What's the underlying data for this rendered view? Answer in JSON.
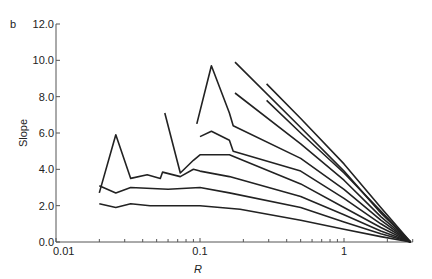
{
  "panel_label": "b",
  "chart_data": {
    "type": "line",
    "title": "",
    "panel": "b",
    "xlabel": "R",
    "ylabel": "Slope",
    "xscale": "log",
    "xlim": [
      0.01,
      3.0
    ],
    "ylim": [
      0.0,
      12.0
    ],
    "x_ticks": [
      {
        "value": 0.01,
        "label": "0.01"
      },
      {
        "value": 0.1,
        "label": "0.1"
      },
      {
        "value": 1,
        "label": "1"
      }
    ],
    "y_ticks": [
      {
        "value": 0,
        "label": "0.0"
      },
      {
        "value": 2,
        "label": "2.0"
      },
      {
        "value": 4,
        "label": "4.0"
      },
      {
        "value": 6,
        "label": "6.0"
      },
      {
        "value": 8,
        "label": "8.0"
      },
      {
        "value": 10,
        "label": "10.0"
      },
      {
        "value": 12,
        "label": "12.0"
      }
    ],
    "grid": false,
    "legend": null,
    "series": [
      {
        "name": "curve-1",
        "x": [
          0.02,
          0.026,
          0.033,
          0.045,
          0.1,
          0.19,
          0.5,
          1.0,
          1.8,
          2.9
        ],
        "y": [
          2.1,
          1.9,
          2.1,
          2.0,
          2.0,
          1.8,
          1.2,
          0.7,
          0.3,
          0.0
        ]
      },
      {
        "name": "curve-2",
        "x": [
          0.02,
          0.026,
          0.033,
          0.06,
          0.1,
          0.16,
          0.5,
          1.0,
          1.8,
          2.9
        ],
        "y": [
          3.1,
          2.7,
          3.0,
          2.9,
          3.0,
          2.7,
          1.9,
          1.1,
          0.45,
          0.0
        ]
      },
      {
        "name": "curve-3",
        "x": [
          0.02,
          0.026,
          0.033,
          0.043,
          0.053,
          0.055,
          0.073,
          0.09,
          0.1,
          0.16,
          0.5,
          1.0,
          1.8,
          2.9
        ],
        "y": [
          2.7,
          5.9,
          3.5,
          3.7,
          3.5,
          3.85,
          3.6,
          4.0,
          3.9,
          3.6,
          2.5,
          1.5,
          0.6,
          0.0
        ]
      },
      {
        "name": "curve-4",
        "x": [
          0.057,
          0.073,
          0.09,
          0.1,
          0.16,
          0.5,
          1.0,
          1.8,
          2.9
        ],
        "y": [
          7.1,
          3.8,
          4.5,
          4.8,
          4.8,
          3.2,
          1.9,
          0.8,
          0.0
        ]
      },
      {
        "name": "curve-5",
        "x": [
          0.1,
          0.12,
          0.16,
          0.17,
          0.5,
          1.0,
          1.8,
          2.9
        ],
        "y": [
          5.8,
          6.1,
          5.6,
          5.0,
          3.9,
          2.4,
          1.0,
          0.0
        ]
      },
      {
        "name": "curve-6",
        "x": [
          0.095,
          0.12,
          0.16,
          0.17,
          0.5,
          1.0,
          1.8,
          2.9
        ],
        "y": [
          6.5,
          9.7,
          7.1,
          6.4,
          4.6,
          2.9,
          1.2,
          0.0
        ]
      },
      {
        "name": "curve-7",
        "x": [
          0.175,
          0.5,
          1.0,
          1.8,
          2.9
        ],
        "y": [
          8.2,
          5.4,
          3.4,
          1.4,
          0.0
        ]
      },
      {
        "name": "curve-8",
        "x": [
          0.175,
          0.5,
          1.0,
          1.8,
          2.9
        ],
        "y": [
          9.9,
          6.3,
          3.9,
          1.6,
          0.0
        ]
      },
      {
        "name": "curve-9",
        "x": [
          0.29,
          0.5,
          1.0,
          1.8,
          2.9
        ],
        "y": [
          7.8,
          6.0,
          3.8,
          1.7,
          0.0
        ]
      },
      {
        "name": "curve-10",
        "x": [
          0.29,
          0.5,
          1.0,
          1.8,
          2.9
        ],
        "y": [
          8.7,
          6.8,
          4.3,
          1.9,
          0.0
        ]
      }
    ]
  }
}
